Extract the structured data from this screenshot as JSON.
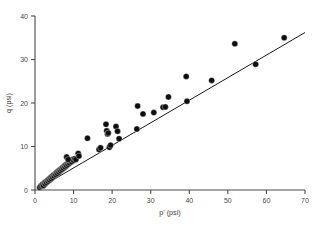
{
  "chart_data": {
    "type": "scatter",
    "title": "",
    "xlabel": "p' (psi)",
    "ylabel": "q (psi)",
    "xlim": [
      0,
      70
    ],
    "ylim": [
      0,
      40
    ],
    "xticks": [
      0,
      10,
      20,
      30,
      40,
      50,
      60,
      70
    ],
    "yticks": [
      0,
      10,
      20,
      30,
      40
    ],
    "grid": false,
    "legend": null,
    "marker": "filled-circle",
    "marker_color": "#0d0d0d",
    "line_color": "#1a1a1a",
    "axis_color": "#4a4a4a",
    "series": [
      {
        "name": "measurements",
        "points": [
          [
            1.2,
            0.6
          ],
          [
            1.5,
            0.9
          ],
          [
            1.8,
            1.1
          ],
          [
            2.0,
            1.3
          ],
          [
            2.2,
            1.0
          ],
          [
            2.4,
            1.6
          ],
          [
            2.6,
            1.4
          ],
          [
            2.8,
            1.9
          ],
          [
            3.0,
            1.7
          ],
          [
            3.2,
            2.2
          ],
          [
            3.4,
            2.0
          ],
          [
            3.6,
            2.5
          ],
          [
            3.8,
            2.3
          ],
          [
            4.0,
            2.8
          ],
          [
            4.2,
            2.6
          ],
          [
            4.4,
            3.1
          ],
          [
            4.6,
            2.9
          ],
          [
            4.8,
            3.4
          ],
          [
            5.0,
            3.2
          ],
          [
            5.2,
            3.7
          ],
          [
            5.4,
            3.5
          ],
          [
            5.6,
            4.0
          ],
          [
            5.8,
            3.8
          ],
          [
            6.0,
            4.3
          ],
          [
            6.2,
            4.1
          ],
          [
            6.4,
            4.6
          ],
          [
            6.6,
            4.4
          ],
          [
            6.8,
            4.9
          ],
          [
            7.0,
            4.7
          ],
          [
            7.2,
            5.2
          ],
          [
            7.4,
            5.0
          ],
          [
            7.6,
            5.5
          ],
          [
            7.8,
            5.3
          ],
          [
            8.0,
            5.8
          ],
          [
            8.2,
            5.6
          ],
          [
            8.4,
            6.1
          ],
          [
            8.6,
            5.9
          ],
          [
            8.8,
            6.4
          ],
          [
            9.0,
            6.2
          ],
          [
            9.2,
            6.7
          ],
          [
            9.5,
            6.5
          ],
          [
            9.8,
            7.0
          ],
          [
            10.0,
            6.8
          ],
          [
            10.3,
            7.2
          ],
          [
            10.6,
            7.0
          ],
          [
            8.2,
            7.6
          ],
          [
            8.6,
            7.0
          ],
          [
            11.2,
            8.4
          ],
          [
            11.4,
            7.8
          ],
          [
            13.6,
            11.9
          ],
          [
            16.6,
            9.3
          ],
          [
            17.0,
            9.7
          ],
          [
            18.4,
            15.1
          ],
          [
            18.6,
            13.6
          ],
          [
            18.8,
            12.9
          ],
          [
            19.0,
            13.1
          ],
          [
            19.3,
            9.8
          ],
          [
            19.6,
            10.3
          ],
          [
            21.0,
            14.6
          ],
          [
            21.4,
            13.5
          ],
          [
            21.8,
            11.8
          ],
          [
            26.4,
            14.0
          ],
          [
            26.6,
            19.3
          ],
          [
            28.0,
            17.5
          ],
          [
            30.8,
            17.8
          ],
          [
            33.2,
            19.0
          ],
          [
            33.8,
            19.1
          ],
          [
            34.6,
            21.4
          ],
          [
            39.2,
            26.1
          ],
          [
            39.4,
            20.4
          ],
          [
            45.8,
            25.2
          ],
          [
            51.8,
            33.6
          ],
          [
            57.2,
            28.9
          ],
          [
            64.6,
            35.0
          ]
        ]
      }
    ],
    "fit_line": {
      "name": "trend-line",
      "x0": 1.0,
      "y0": 0.4,
      "x1": 70.0,
      "y1": 36.2
    }
  }
}
